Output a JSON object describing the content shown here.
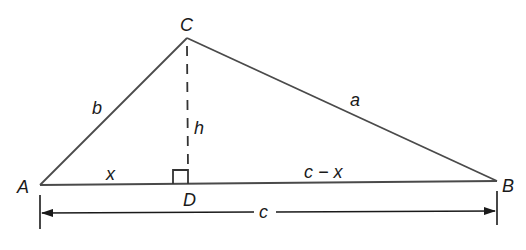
{
  "diagram": {
    "type": "triangle-with-altitude",
    "stroke_color": "#4a4a4a",
    "text_color": "#1a1a1a",
    "vertices": {
      "A": {
        "label": "A",
        "x": 40,
        "y": 185
      },
      "B": {
        "label": "B",
        "x": 497,
        "y": 181
      },
      "C": {
        "label": "C",
        "x": 187,
        "y": 38
      },
      "D": {
        "label": "D",
        "x": 188,
        "y": 184
      }
    },
    "sides": {
      "a": "a",
      "b": "b",
      "c": "c"
    },
    "altitude": {
      "label": "h",
      "style": "dashed"
    },
    "segments": {
      "AD": "x",
      "DB": "c − x"
    },
    "dimension": {
      "label": "c",
      "from": "A",
      "to": "B",
      "arrows": "both"
    },
    "right_angle_marker": "D"
  }
}
